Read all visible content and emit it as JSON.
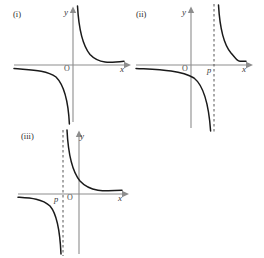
{
  "figure": {
    "kind": "math-graph-figure",
    "colors": {
      "background": "#ffffff",
      "axis": "#8d8d8d",
      "curve": "#1a1a1a",
      "asymptote": "#555555",
      "text": "#2b2b2b"
    },
    "panels": [
      {
        "id": "panel-i",
        "label": "(i)",
        "x_axis_label": "x",
        "y_axis_label": "y",
        "origin_label": "O",
        "asymptote_label": null,
        "has_vertical_asymptote_line": false,
        "curve_type": "hyperbola",
        "vertical_asymptote_x": 0,
        "horizontal_asymptote_y": 0,
        "branches": [
          "upper-right",
          "lower-left"
        ]
      },
      {
        "id": "panel-ii",
        "label": "(ii)",
        "x_axis_label": "x",
        "y_axis_label": "y",
        "origin_label": "O",
        "asymptote_label": "p",
        "has_vertical_asymptote_line": true,
        "curve_type": "hyperbola",
        "vertical_asymptote_x": "p",
        "asymptote_sign": "positive",
        "horizontal_asymptote_y": 0,
        "branches": [
          "upper-right",
          "lower-left"
        ]
      },
      {
        "id": "panel-iii",
        "label": "(iii)",
        "x_axis_label": "x",
        "y_axis_label": "y",
        "origin_label": "O",
        "asymptote_label": "p",
        "has_vertical_asymptote_line": true,
        "curve_type": "hyperbola",
        "vertical_asymptote_x": "p",
        "asymptote_sign": "negative",
        "horizontal_asymptote_y": 0,
        "branches": [
          "upper-right",
          "lower-left"
        ]
      }
    ]
  }
}
